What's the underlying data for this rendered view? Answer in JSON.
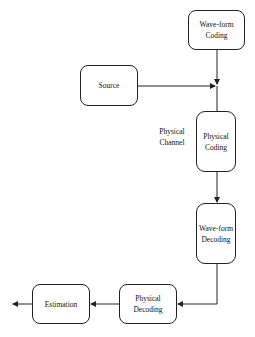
{
  "diagram": {
    "nodes": {
      "waveform_coding": {
        "line1": "Wave-form",
        "line2": "Coding"
      },
      "source": {
        "label": "Source"
      },
      "physical_coding": {
        "line1": "Physical",
        "line2": "Coding"
      },
      "waveform_decoding": {
        "line1": "Wave-form",
        "line2": "Decoding"
      },
      "physical_decoding": {
        "line1": "Physical",
        "line2": "Decoding"
      },
      "estimation": {
        "label": "Estimation"
      }
    },
    "labels": {
      "physical_channel": {
        "line1": "Physical",
        "line2": "Channel"
      }
    },
    "edges": [
      {
        "from": "waveform_coding",
        "to": "junction"
      },
      {
        "from": "source",
        "to": "junction"
      },
      {
        "from": "junction",
        "to": "physical_coding"
      },
      {
        "from": "physical_coding",
        "to": "waveform_decoding"
      },
      {
        "from": "waveform_decoding",
        "to": "physical_decoding"
      },
      {
        "from": "physical_decoding",
        "to": "estimation"
      },
      {
        "from": "estimation",
        "to": "output"
      }
    ]
  }
}
